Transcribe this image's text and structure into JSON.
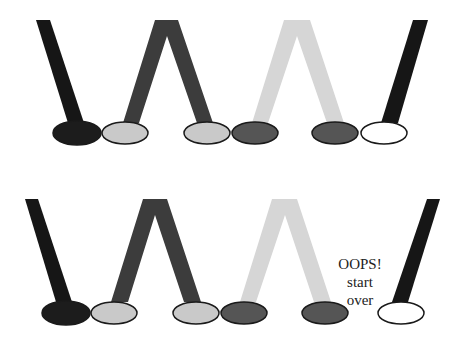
{
  "diagram": {
    "colors": {
      "black": "#161616",
      "dark": "#3c3c3c",
      "light": "#cfcfcf",
      "dark_foot": "#555555",
      "light_foot": "#c8c8c8",
      "white": "#ffffff",
      "outline": "#1a1a1a"
    },
    "rows": [
      {
        "name": "top-row",
        "feet": [
          "black",
          "light",
          "light",
          "dark",
          "dark",
          "white"
        ],
        "legs": [
          "black-left-leg",
          "dark-lambda-leg",
          "light-lambda-leg",
          "black-right-leg"
        ]
      },
      {
        "name": "bottom-row",
        "feet": [
          "black",
          "light",
          "light",
          "dark",
          "dark",
          "white"
        ],
        "legs": [
          "black-left-leg",
          "dark-lambda-leg",
          "light-lambda-leg",
          "black-right-leg"
        ]
      }
    ],
    "annotation": {
      "line1": "OOPS!",
      "line2": "start",
      "line3": "over"
    }
  }
}
